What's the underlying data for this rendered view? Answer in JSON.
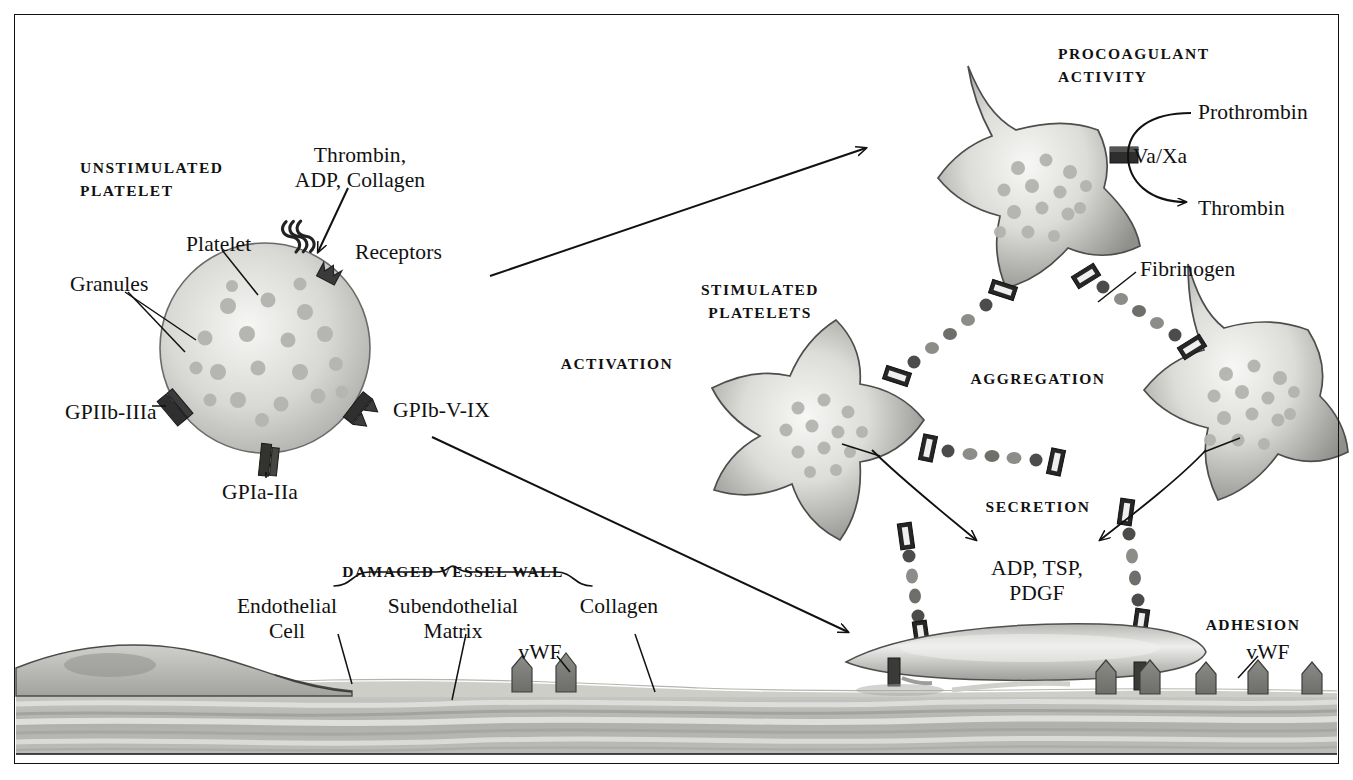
{
  "figure": {
    "frame_color": "#111111",
    "background": "#ffffff"
  },
  "section_captions": [
    {
      "id": "unstimulated-platelet",
      "text": "UNSTIMULATED\nPLATELET",
      "x": 80,
      "y": 156,
      "align": "left"
    },
    {
      "id": "procoagulant-activity",
      "text": "PROCOAGULANT\nACTIVITY",
      "x": 1058,
      "y": 42,
      "align": "left"
    },
    {
      "id": "stimulated-platelets",
      "text": "STIMULATED\nPLATELETS",
      "x": 760,
      "y": 278,
      "align": "center"
    },
    {
      "id": "activation",
      "text": "ACTIVATION",
      "x": 617,
      "y": 352,
      "align": "center"
    },
    {
      "id": "aggregation",
      "text": "AGGREGATION",
      "x": 1038,
      "y": 367,
      "align": "center"
    },
    {
      "id": "secretion",
      "text": "SECRETION",
      "x": 1038,
      "y": 495,
      "align": "center"
    },
    {
      "id": "adhesion",
      "text": "ADHESION",
      "x": 1253,
      "y": 613,
      "align": "center"
    },
    {
      "id": "damaged-vessel-wall",
      "text": "DAMAGED VESSEL WALL",
      "x": 453,
      "y": 560,
      "align": "center"
    }
  ],
  "labels": [
    {
      "id": "agonists",
      "text": "Thrombin,\nADP, Collagen",
      "x": 360,
      "y": 143,
      "align": "center"
    },
    {
      "id": "platelet",
      "text": "Platelet",
      "x": 186,
      "y": 232,
      "align": "left"
    },
    {
      "id": "granules",
      "text": "Granules",
      "x": 70,
      "y": 272,
      "align": "left"
    },
    {
      "id": "receptors",
      "text": "Receptors",
      "x": 355,
      "y": 240,
      "align": "left"
    },
    {
      "id": "gpIIb-IIIa",
      "text": "GPIIb-IIIa",
      "x": 65,
      "y": 400,
      "align": "left"
    },
    {
      "id": "gpIa-IIa",
      "text": "GPIa-IIa",
      "x": 222,
      "y": 480,
      "align": "left"
    },
    {
      "id": "gpIb-V-IX",
      "text": "GPIb-V-IX",
      "x": 393,
      "y": 398,
      "align": "left"
    },
    {
      "id": "prothrombin",
      "text": "Prothrombin",
      "x": 1198,
      "y": 100,
      "align": "left"
    },
    {
      "id": "va-xa",
      "text": "Va/Xa",
      "x": 1133,
      "y": 144,
      "align": "left"
    },
    {
      "id": "thrombin",
      "text": "Thrombin",
      "x": 1198,
      "y": 196,
      "align": "left"
    },
    {
      "id": "fibrinogen",
      "text": "Fibrinogen",
      "x": 1140,
      "y": 257,
      "align": "left"
    },
    {
      "id": "secretion-products",
      "text": "ADP, TSP,\nPDGF",
      "x": 1037,
      "y": 556,
      "align": "center"
    },
    {
      "id": "endothelial-cell",
      "text": "Endothelial\nCell",
      "x": 287,
      "y": 594,
      "align": "center"
    },
    {
      "id": "subendothelial-matrix",
      "text": "Subendothelial\nMatrix",
      "x": 453,
      "y": 594,
      "align": "center"
    },
    {
      "id": "collagen",
      "text": "Collagen",
      "x": 619,
      "y": 594,
      "align": "center"
    },
    {
      "id": "vwf-matrix",
      "text": "vWF",
      "x": 540,
      "y": 640,
      "align": "center"
    },
    {
      "id": "vwf-adhesion",
      "text": "vWF",
      "x": 1268,
      "y": 640,
      "align": "center"
    }
  ],
  "colors": {
    "ink": "#111111",
    "platelet_edge": "#3f3f3f",
    "platelet_fill_light": "#f2f2f0",
    "platelet_fill_mid": "#c9c9c7",
    "platelet_fill_dark": "#8d8d8b",
    "granule": "#b9b9b6",
    "receptor_dark": "#2b2b2b",
    "receptor_mid": "#6e6e6e",
    "vwf": "#7c7c7a",
    "tissue_light": "#d9d9d6",
    "tissue_mid": "#b8b8b4",
    "tissue_dark": "#9a9a96"
  },
  "counts": {
    "unstimulated_granules": 20,
    "stimulated_platelets": 3,
    "vwf_matrix_molecules": 2,
    "vwf_adhesion_molecules": 4
  }
}
